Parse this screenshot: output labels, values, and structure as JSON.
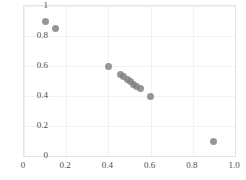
{
  "chart_data": {
    "type": "scatter",
    "title": "",
    "xlabel": "",
    "ylabel": "",
    "xlim": [
      0,
      1.0
    ],
    "ylim": [
      0,
      1.0
    ],
    "grid": true,
    "legend": null,
    "marker": {
      "shape": "circle",
      "color": "#7f7f7f",
      "size_px": 7,
      "opacity": 0.82
    },
    "xticks": [
      0,
      0.2,
      0.4,
      0.6,
      0.8,
      1.0
    ],
    "xtick_labels": [
      "0",
      "0.2",
      "0.4",
      "0.6",
      "0.8",
      "1.0"
    ],
    "yticks": [
      0,
      0.2,
      0.4,
      0.6,
      0.8,
      1.0
    ],
    "ytick_labels": [
      "0",
      "0.2",
      "0.4",
      "0.6",
      "0.8",
      "1"
    ],
    "points": [
      {
        "x": 0.1,
        "y": 0.9
      },
      {
        "x": 0.15,
        "y": 0.85
      },
      {
        "x": 0.4,
        "y": 0.6
      },
      {
        "x": 0.455,
        "y": 0.545
      },
      {
        "x": 0.47,
        "y": 0.53
      },
      {
        "x": 0.49,
        "y": 0.51
      },
      {
        "x": 0.505,
        "y": 0.495
      },
      {
        "x": 0.52,
        "y": 0.48
      },
      {
        "x": 0.535,
        "y": 0.465
      },
      {
        "x": 0.55,
        "y": 0.45
      },
      {
        "x": 0.6,
        "y": 0.4
      },
      {
        "x": 0.9,
        "y": 0.1
      }
    ]
  },
  "colors": {
    "marker": "#7f7f7f",
    "gridline": "#f2f2f2",
    "frame": "#e3e3e3",
    "tick_text": "#4d4d4d",
    "background": "#ffffff"
  }
}
